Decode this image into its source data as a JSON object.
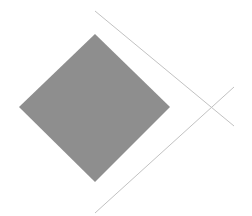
{
  "diagram": {
    "background": "#ffffff",
    "diamond": {
      "points": [
        [
          95,
          34
        ],
        [
          170,
          107
        ],
        [
          95,
          182
        ],
        [
          19,
          107
        ]
      ],
      "fill": "#8e8e8e"
    },
    "lines": [
      {
        "name": "upper-diagonal-line",
        "x1": 95,
        "y1": 11,
        "x2": 234,
        "y2": 126,
        "stroke": "#c2c2c2"
      },
      {
        "name": "lower-diagonal-line",
        "x1": 95,
        "y1": 213,
        "x2": 234,
        "y2": 87,
        "stroke": "#c2c2c2"
      }
    ]
  }
}
